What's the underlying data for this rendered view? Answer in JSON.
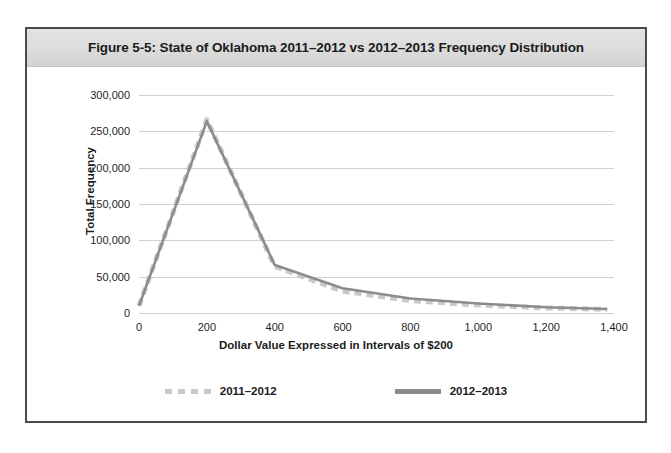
{
  "figure": {
    "title": "Figure 5-5: State of Oklahoma 2011–2012 vs 2012–2013 Frequency Distribution"
  },
  "chart_data": {
    "type": "line",
    "title": "Figure 5-5: State of Oklahoma 2011–2012 vs 2012–2013 Frequency Distribution",
    "xlabel": "Dollar Value Expressed in Intervals of $200",
    "ylabel": "Total Frequency",
    "x": [
      0,
      200,
      400,
      600,
      800,
      1000,
      1200,
      1380
    ],
    "xlim": [
      0,
      1400
    ],
    "ylim": [
      0,
      300000
    ],
    "xticks": [
      0,
      200,
      400,
      600,
      800,
      1000,
      1200,
      1400
    ],
    "xtick_labels": [
      "0",
      "200",
      "400",
      "600",
      "800",
      "1,000",
      "1,200",
      "1,400"
    ],
    "yticks": [
      0,
      50000,
      100000,
      150000,
      200000,
      250000,
      300000
    ],
    "ytick_labels": [
      "0",
      "50,000",
      "100,000",
      "150,000",
      "200,000",
      "250,000",
      "300,000"
    ],
    "grid": "horizontal",
    "legend_position": "bottom",
    "series": [
      {
        "name": "2011–2012",
        "style": "dashed",
        "color": "#c9c9c9",
        "values": [
          10000,
          266000,
          64000,
          30000,
          17000,
          11000,
          7000,
          5000
        ]
      },
      {
        "name": "2012–2013",
        "style": "solid",
        "color": "#8c8c8c",
        "values": [
          10000,
          264000,
          66000,
          34000,
          20000,
          13000,
          8000,
          5500
        ]
      }
    ]
  },
  "legend": {
    "items": [
      {
        "label": "2011–2012",
        "swatch": "dashed-line-swatch"
      },
      {
        "label": "2012–2013",
        "swatch": "solid-line-swatch"
      }
    ]
  }
}
